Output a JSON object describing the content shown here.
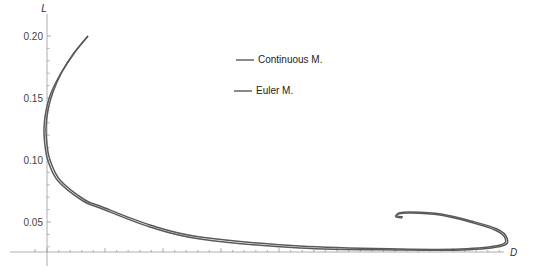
{
  "chart_data": {
    "type": "line",
    "title": "",
    "xlabel": "D",
    "ylabel": "L",
    "y_ticks": [
      "0.05",
      "0.10",
      "0.15",
      "0.20"
    ],
    "ylim": [
      0.025,
      0.21
    ],
    "grid": false,
    "legend_position": "top-center",
    "series": [
      {
        "name": "Continuous M.",
        "color": "#5a5a5a",
        "points_px": [
          [
            88,
            36
          ],
          [
            75,
            52
          ],
          [
            62,
            72
          ],
          [
            53,
            92
          ],
          [
            48,
            110
          ],
          [
            46,
            128
          ],
          [
            47,
            145
          ],
          [
            50,
            160
          ],
          [
            60,
            180
          ],
          [
            85,
            200
          ],
          [
            100,
            206
          ],
          [
            150,
            225
          ],
          [
            200,
            237
          ],
          [
            300,
            246
          ],
          [
            400,
            249
          ],
          [
            460,
            249
          ],
          [
            500,
            245
          ],
          [
            505,
            238
          ],
          [
            495,
            230
          ],
          [
            470,
            222
          ],
          [
            440,
            215
          ],
          [
            410,
            213
          ],
          [
            398,
            214
          ],
          [
            396,
            217
          ],
          [
            402,
            218
          ]
        ]
      },
      {
        "name": "Euler M.",
        "color": "#5a5a5a",
        "points_px": [
          [
            88,
            36
          ],
          [
            74,
            53
          ],
          [
            61,
            73
          ],
          [
            51,
            93
          ],
          [
            46,
            111
          ],
          [
            44,
            128
          ],
          [
            45,
            146
          ],
          [
            48,
            161
          ],
          [
            58,
            181
          ],
          [
            83,
            201
          ],
          [
            100,
            208
          ],
          [
            150,
            227
          ],
          [
            200,
            239
          ],
          [
            300,
            248
          ],
          [
            400,
            250
          ],
          [
            462,
            250
          ],
          [
            502,
            246
          ],
          [
            507,
            238
          ],
          [
            497,
            229
          ],
          [
            471,
            221
          ],
          [
            441,
            214
          ],
          [
            411,
            212
          ],
          [
            399,
            213
          ],
          [
            397,
            216
          ],
          [
            403,
            217
          ]
        ]
      }
    ]
  },
  "legend": {
    "items": [
      {
        "label": "Continuous M."
      },
      {
        "label": "Euler M."
      }
    ]
  },
  "axes": {
    "x_label": "D",
    "y_label": "L",
    "y_tick_labels": [
      "0.20",
      "0.15",
      "0.10",
      "0.05"
    ]
  }
}
